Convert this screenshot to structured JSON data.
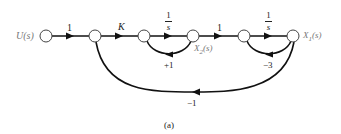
{
  "diagram": {
    "type": "signal-flow-graph",
    "caption": "(a)",
    "input_label": "U(s)",
    "nodes": [
      {
        "id": "n1",
        "label": "U(s)"
      },
      {
        "id": "n2",
        "label": ""
      },
      {
        "id": "n3",
        "label": ""
      },
      {
        "id": "n4",
        "label": "X2(s)"
      },
      {
        "id": "n5",
        "label": ""
      },
      {
        "id": "n6",
        "label": "X1(s)"
      }
    ],
    "node_labels": {
      "u": "U(s)",
      "x2_main": "X",
      "x2_sub": "2",
      "x2_tail": "(s)",
      "x1_main": "X",
      "x1_sub": "1",
      "x1_tail": "(s)"
    },
    "branches": [
      {
        "from": "n1",
        "to": "n2",
        "gain": "1"
      },
      {
        "from": "n2",
        "to": "n3",
        "gain": "K"
      },
      {
        "from": "n3",
        "to": "n4",
        "gain_num": "1",
        "gain_den": "s"
      },
      {
        "from": "n4",
        "to": "n3",
        "gain": "+1"
      },
      {
        "from": "n4",
        "to": "n5",
        "gain": "1"
      },
      {
        "from": "n5",
        "to": "n6",
        "gain_num": "1",
        "gain_den": "s"
      },
      {
        "from": "n6",
        "to": "n5",
        "gain": "−3"
      },
      {
        "from": "n6",
        "to": "n2",
        "gain": "−1"
      }
    ]
  }
}
